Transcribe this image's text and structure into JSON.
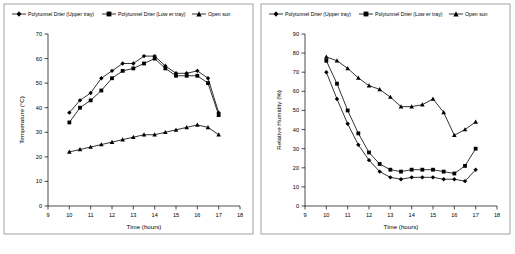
{
  "charts": [
    {
      "name": "temperature-chart",
      "legend": [
        {
          "label": "Polytunnel Drier (Upper tray)",
          "marker": "diamond"
        },
        {
          "label": "Polytunnel Drier (Low er tray)",
          "marker": "square"
        },
        {
          "label": "Open sun",
          "marker": "triangle"
        }
      ],
      "xlabel": "Time (hours)",
      "ylabel": "Temperature (°C)",
      "xticks": [
        "9",
        "10",
        "11",
        "12",
        "13",
        "14",
        "15",
        "16",
        "17",
        "18"
      ],
      "yticks": [
        "0",
        "10",
        "20",
        "30",
        "40",
        "50",
        "60",
        "70"
      ],
      "chart_data": {
        "type": "line",
        "title": "",
        "xlabel": "Time (hours)",
        "ylabel": "Temperature (°C)",
        "xlim": [
          9,
          18
        ],
        "ylim": [
          0,
          70
        ],
        "grid": false,
        "legend_position": "top",
        "x": [
          10,
          10.5,
          11,
          11.5,
          12,
          12.5,
          13,
          13.5,
          14,
          14.5,
          15,
          15.5,
          16,
          16.5,
          17
        ],
        "series": [
          {
            "name": "Polytunnel Drier (Upper tray)",
            "marker": "diamond",
            "values": [
              38,
              43,
              46,
              52,
              55,
              58,
              58,
              61,
              61,
              57,
              54,
              54,
              55,
              52,
              38
            ]
          },
          {
            "name": "Polytunnel Drier (Low er tray)",
            "marker": "square",
            "values": [
              34,
              40,
              43,
              47,
              52,
              55,
              56,
              58,
              60,
              56,
              53,
              53,
              53,
              50,
              37
            ]
          },
          {
            "name": "Open sun",
            "marker": "triangle",
            "values": [
              22,
              23,
              24,
              25,
              26,
              27,
              28,
              29,
              29,
              30,
              31,
              32,
              33,
              32,
              29
            ]
          }
        ]
      }
    },
    {
      "name": "humidity-chart",
      "legend": [
        {
          "label": "Polytunnel Drier (Upper tray)",
          "marker": "diamond"
        },
        {
          "label": "Polytunnel Drier (Low er tray)",
          "marker": "square"
        },
        {
          "label": "Open sun",
          "marker": "triangle"
        }
      ],
      "xlabel": "Time (hours)",
      "ylabel": "Relative Humidity (%)",
      "xticks": [
        "9",
        "10",
        "11",
        "12",
        "13",
        "14",
        "15",
        "16",
        "17",
        "18"
      ],
      "yticks": [
        "0",
        "10",
        "20",
        "30",
        "40",
        "50",
        "60",
        "70",
        "80",
        "90"
      ],
      "chart_data": {
        "type": "line",
        "title": "",
        "xlabel": "Time (hours)",
        "ylabel": "Relative Humidity (%)",
        "xlim": [
          9,
          18
        ],
        "ylim": [
          0,
          90
        ],
        "grid": false,
        "legend_position": "top",
        "x": [
          10,
          10.5,
          11,
          11.5,
          12,
          12.5,
          13,
          13.5,
          14,
          14.5,
          15,
          15.5,
          16,
          16.5,
          17
        ],
        "series": [
          {
            "name": "Polytunnel Drier (Upper tray)",
            "marker": "diamond",
            "values": [
              70,
              56,
              43,
              32,
              24,
              18,
              15,
              14,
              15,
              15,
              15,
              14,
              14,
              13,
              19
            ]
          },
          {
            "name": "Polytunnel Drier (Low er tray)",
            "marker": "square",
            "values": [
              76,
              64,
              50,
              38,
              28,
              22,
              19,
              18,
              19,
              19,
              19,
              18,
              17,
              21,
              30
            ]
          },
          {
            "name": "Open sun",
            "marker": "triangle",
            "values": [
              78,
              76,
              72,
              67,
              63,
              61,
              57,
              52,
              52,
              53,
              56,
              49,
              37,
              40,
              44
            ]
          }
        ]
      }
    }
  ]
}
